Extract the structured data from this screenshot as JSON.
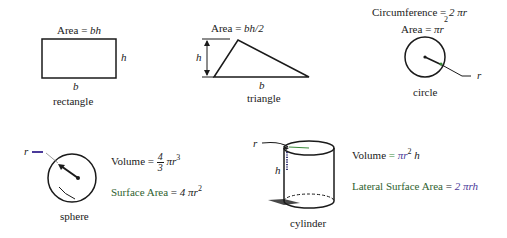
{
  "shapes": {
    "rectangle": {
      "name": "rectangle",
      "formula_label": "Area",
      "formula_eq": "=",
      "formula_expr": "bh",
      "base_label": "b",
      "height_label": "h"
    },
    "triangle": {
      "name": "triangle",
      "formula_label": "Area",
      "formula_eq": "=",
      "formula_expr": "bh/2",
      "base_label": "b",
      "height_label": "h"
    },
    "circle": {
      "name": "circle",
      "circumference_label": "Circumference",
      "circumference_eq": "=",
      "circumference_expr": "2 πr",
      "area_label": "Area",
      "area_eq": "=",
      "area_expr": "πr",
      "area_exp": "2",
      "radius_label": "r"
    },
    "sphere": {
      "name": "sphere",
      "radius_label": "r",
      "volume_label": "Volume",
      "volume_eq": "=",
      "volume_frac_num": "4",
      "volume_frac_den": "3",
      "volume_expr": "πr",
      "volume_exp": "3",
      "surface_label": "Surface Area",
      "surface_eq": "=",
      "surface_expr": "4 πr",
      "surface_exp": "2"
    },
    "cylinder": {
      "name": "cylinder",
      "radius_label": "r",
      "height_label": "h",
      "volume_label": "Volume",
      "volume_eq": "=",
      "volume_expr": "πr",
      "volume_exp": "2",
      "volume_tail": "h",
      "lateral_label": "Lateral Surface Area",
      "lateral_eq": "=",
      "lateral_expr": "2 πrh"
    }
  },
  "colors": {
    "ink": "#1a1a1a",
    "green_accent": "#3a8a3a",
    "purple_accent": "#4b3a9a"
  }
}
